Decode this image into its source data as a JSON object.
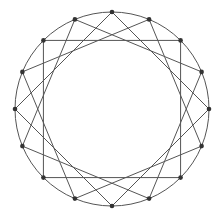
{
  "diagram": {
    "type": "star-polygon",
    "center": [
      112,
      109
    ],
    "radius": 97,
    "point_count": 16,
    "step": 4,
    "colors": {
      "line": "#555555",
      "circle": "#555555",
      "point": "#333333",
      "background": "#ffffff"
    }
  }
}
